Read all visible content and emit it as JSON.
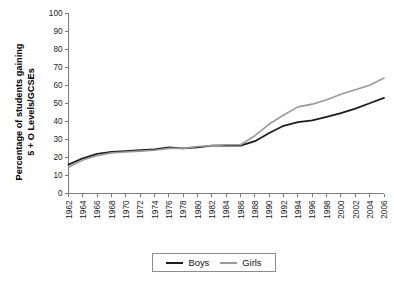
{
  "chart_data": {
    "type": "line",
    "title": "",
    "xlabel": "",
    "ylabel": "Percentage of students gaining 5 + O Levels/GCSEs",
    "ylabel_line1": "Percentage of students gaining",
    "ylabel_line2": "5 + O Levels/GCSEs",
    "ylim": [
      0,
      100
    ],
    "ytick_labels": [
      "0",
      "10",
      "20",
      "30",
      "40",
      "50",
      "60",
      "70",
      "80",
      "90",
      "100"
    ],
    "yticks": [
      0,
      10,
      20,
      30,
      40,
      50,
      60,
      70,
      80,
      90,
      100
    ],
    "grid": false,
    "legend_position": "bottom-center",
    "x": [
      1962,
      1964,
      1966,
      1968,
      1970,
      1972,
      1974,
      1976,
      1978,
      1980,
      1982,
      1984,
      1986,
      1988,
      1990,
      1992,
      1994,
      1996,
      1998,
      2000,
      2002,
      2004,
      2006
    ],
    "categories": [
      "1962",
      "1964",
      "1966",
      "1968",
      "1970",
      "1972",
      "1974",
      "1976",
      "1978",
      "1980",
      "1982",
      "1984",
      "1986",
      "1988",
      "1990",
      "1992",
      "1994",
      "1996",
      "1998",
      "2000",
      "2002",
      "2004",
      "2006"
    ],
    "series": [
      {
        "name": "Boys",
        "color": "#1c1c1c",
        "values": [
          16,
          19.5,
          22,
          23,
          23.5,
          24,
          24.5,
          25.5,
          25,
          25.5,
          26.5,
          26.5,
          26.5,
          29,
          33.5,
          37.5,
          39.5,
          40.5,
          42.5,
          44.5,
          47,
          50,
          53
        ]
      },
      {
        "name": "Girls",
        "color": "#9a9a9a",
        "values": [
          14.5,
          18.5,
          21,
          22.5,
          23,
          23.5,
          24,
          25,
          25,
          26,
          26.5,
          27,
          27,
          32,
          38.5,
          43.5,
          48,
          49.5,
          52,
          55,
          57.5,
          60,
          64
        ]
      }
    ]
  },
  "legend": {
    "items": [
      {
        "label": "Boys",
        "color": "#1c1c1c"
      },
      {
        "label": "Girls",
        "color": "#9a9a9a"
      }
    ]
  },
  "colors": {
    "boys": "#1c1c1c",
    "girls": "#9a9a9a",
    "axis": "#7a7a7a",
    "background": "#ffffff"
  }
}
